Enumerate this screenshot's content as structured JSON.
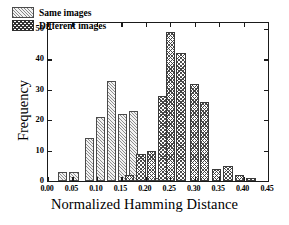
{
  "chart_data": {
    "type": "bar",
    "title": "",
    "subtitle": "",
    "xlabel": "Normalized Hamming Distance",
    "ylabel": "Frequency",
    "xlim": [
      0.0,
      0.45
    ],
    "ylim": [
      0,
      52
    ],
    "xticks": [
      "0.00",
      "0.05",
      "0.10",
      "0.15",
      "0.20",
      "0.25",
      "0.30",
      "0.35",
      "0.40",
      "0.45"
    ],
    "xtick_values": [
      0.0,
      0.05,
      0.1,
      0.15,
      0.2,
      0.25,
      0.3,
      0.35,
      0.4,
      0.45
    ],
    "yticks": [
      "0",
      "10",
      "20",
      "30",
      "40",
      "50"
    ],
    "ytick_values": [
      0,
      10,
      20,
      30,
      40,
      50
    ],
    "grid": false,
    "legend_position": "upper-left",
    "bar_width": 0.019,
    "series": [
      {
        "name": "Same images",
        "fill": "diagonal-hatch",
        "color": "#f2f2f2",
        "x": [
          0.03,
          0.053,
          0.085,
          0.107,
          0.13,
          0.152,
          0.175,
          0.22
        ],
        "values": [
          3,
          3,
          14,
          21,
          33,
          22,
          23,
          1
        ]
      },
      {
        "name": "Different images",
        "fill": "cross-hatch",
        "color": "#ffffff",
        "x": [
          0.167,
          0.19,
          0.212,
          0.235,
          0.25,
          0.272,
          0.3,
          0.32,
          0.345,
          0.368,
          0.392,
          0.415
        ],
        "values": [
          2,
          9,
          10,
          28,
          49,
          42,
          32,
          26,
          4,
          5,
          2,
          1
        ]
      }
    ]
  },
  "legend": {
    "items": [
      {
        "label": "Same images",
        "key": "same"
      },
      {
        "label": "Different images",
        "key": "diff"
      }
    ]
  },
  "axes": {
    "x_title": "Normalized Hamming Distance",
    "y_title": "Frequency"
  }
}
